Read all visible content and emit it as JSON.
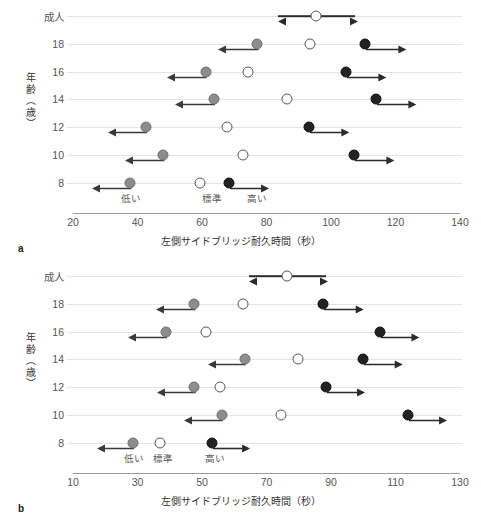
{
  "figure": {
    "panels": [
      {
        "letter": "a",
        "ylabel": "年齢（歳）",
        "xlabel": "左側サイドブリッジ耐久時間（秒）",
        "xticks": [
          "20",
          "40",
          "60",
          "80",
          "100",
          "120",
          "140"
        ],
        "zones": [
          {
            "label": "低い",
            "value": 38
          },
          {
            "label": "標準",
            "value": 63
          },
          {
            "label": "高い",
            "value": 77
          }
        ],
        "rows": [
          {
            "label": "成人",
            "low": null,
            "low_arrow_to": null,
            "normal": 95.5,
            "high": null,
            "high_arrow_to": null,
            "open_arrow_from": 83.7,
            "open_arrow_to": 107.6
          },
          {
            "label": "18",
            "low": 77.2,
            "low_arrow_to": 64.9,
            "normal": 93.4,
            "high": 110.4,
            "high_arrow_to": 122.6
          },
          {
            "label": "16",
            "low": 61.1,
            "low_arrow_to": 49.2,
            "normal": 74.2,
            "high": 104.7,
            "high_arrow_to": 116.6
          },
          {
            "label": "14",
            "low": 63.7,
            "low_arrow_to": 51.6,
            "normal": 86.3,
            "high": 113.8,
            "high_arrow_to": 125.7
          },
          {
            "label": "12",
            "low": 42.5,
            "low_arrow_to": 30.7,
            "normal": 67.7,
            "high": 93.3,
            "high_arrow_to": 105.2
          },
          {
            "label": "10",
            "low": 48.0,
            "low_arrow_to": 36.1,
            "normal": 72.6,
            "high": 107.1,
            "high_arrow_to": 119.0
          },
          {
            "label": "8",
            "low": 37.8,
            "low_arrow_to": 25.9,
            "normal": 59.4,
            "high": 68.5,
            "high_arrow_to": 80.3
          }
        ]
      },
      {
        "letter": "b",
        "ylabel": "年齢（歳）",
        "xlabel": "左側サイドブリッジ耐久時間（秒）",
        "xticks": [
          "10",
          "30",
          "50",
          "70",
          "90",
          "110",
          "130"
        ],
        "zones": [
          {
            "label": "低い",
            "value": 29
          },
          {
            "label": "標準",
            "value": 38
          },
          {
            "label": "高い",
            "value": 54
          }
        ],
        "rows": [
          {
            "label": "成人",
            "low": null,
            "low_arrow_to": null,
            "normal": 76.4,
            "high": null,
            "high_arrow_to": null,
            "open_arrow_from": 64.7,
            "open_arrow_to": 88.3
          },
          {
            "label": "18",
            "low": 47.5,
            "low_arrow_to": 35.6,
            "normal": 62.6,
            "high": 87.4,
            "high_arrow_to": 99.4
          },
          {
            "label": "16",
            "low": 38.7,
            "low_arrow_to": 26.9,
            "normal": 51.2,
            "high": 105.2,
            "high_arrow_to": 116.8
          },
          {
            "label": "14",
            "low": 63.2,
            "low_arrow_to": 51.8,
            "normal": 79.7,
            "high": 99.9,
            "high_arrow_to": 111.6
          },
          {
            "label": "12",
            "low": 47.6,
            "low_arrow_to": 35.9,
            "normal": 55.6,
            "high": 88.4,
            "high_arrow_to": 99.9
          },
          {
            "label": "10",
            "low": 56.1,
            "low_arrow_to": 44.4,
            "normal": 74.4,
            "high": 113.9,
            "high_arrow_to": 125.4
          },
          {
            "label": "8",
            "low": 28.7,
            "low_arrow_to": 17.5,
            "normal": 36.9,
            "high": 53.2,
            "high_arrow_to": 64.4
          }
        ]
      }
    ]
  },
  "chart_data": {
    "type": "scatter",
    "title": "",
    "xlabel": "左側サイドブリッジ耐久時間（秒）",
    "ylabel": "年齢（歳）",
    "categories": [
      "成人",
      "18",
      "16",
      "14",
      "12",
      "10",
      "8"
    ],
    "legend": [
      "低い（灰色・左向き矢印）",
      "標準（白丸）",
      "高い（黒丸・右向き矢印）"
    ],
    "annotations": [
      "低い",
      "標準",
      "高い"
    ],
    "grid": true,
    "panels": [
      {
        "id": "a",
        "label": "a",
        "xlim": [
          20,
          140
        ],
        "xticks": [
          20,
          40,
          60,
          80,
          100,
          120,
          140
        ],
        "series": [
          {
            "name": "低い（灰丸）",
            "marker": "gray-filled-circle",
            "values": [
              null,
              77.2,
              61.1,
              63.7,
              42.5,
              48.0,
              37.8
            ]
          },
          {
            "name": "低い矢印終点",
            "marker": "left-arrow-end",
            "values": [
              null,
              64.9,
              49.2,
              51.6,
              30.7,
              36.1,
              25.9
            ]
          },
          {
            "name": "標準（白丸）",
            "marker": "open-circle",
            "values": [
              95.5,
              93.4,
              74.2,
              86.3,
              67.7,
              72.6,
              59.4
            ]
          },
          {
            "name": "高い（黒丸）",
            "marker": "black-filled-circle",
            "values": [
              null,
              110.4,
              104.7,
              113.8,
              93.3,
              107.1,
              68.5
            ]
          },
          {
            "name": "高い矢印終点",
            "marker": "right-arrow-end",
            "values": [
              null,
              122.6,
              116.6,
              125.7,
              105.2,
              119.0,
              80.3
            ]
          },
          {
            "name": "成人両矢印範囲",
            "marker": "double-arrow",
            "values": [
              [
                83.7,
                107.6
              ],
              null,
              null,
              null,
              null,
              null,
              null
            ]
          }
        ]
      },
      {
        "id": "b",
        "label": "b",
        "xlim": [
          10,
          130
        ],
        "xticks": [
          10,
          30,
          50,
          70,
          90,
          110,
          130
        ],
        "series": [
          {
            "name": "低い（灰丸）",
            "marker": "gray-filled-circle",
            "values": [
              null,
              47.5,
              38.7,
              63.2,
              47.6,
              56.1,
              28.7
            ]
          },
          {
            "name": "低い矢印終点",
            "marker": "left-arrow-end",
            "values": [
              null,
              35.6,
              26.9,
              51.8,
              35.9,
              44.4,
              17.5
            ]
          },
          {
            "name": "標準（白丸）",
            "marker": "open-circle",
            "values": [
              76.4,
              62.6,
              51.2,
              79.7,
              55.6,
              74.4,
              36.9
            ]
          },
          {
            "name": "高い（黒丸）",
            "marker": "black-filled-circle",
            "values": [
              null,
              87.4,
              105.2,
              99.9,
              88.4,
              113.9,
              53.2
            ]
          },
          {
            "name": "高い矢印終点",
            "marker": "right-arrow-end",
            "values": [
              null,
              99.4,
              116.8,
              111.6,
              99.9,
              125.4,
              64.4
            ]
          },
          {
            "name": "成人両矢印範囲",
            "marker": "double-arrow",
            "values": [
              [
                64.7,
                88.3
              ],
              null,
              null,
              null,
              null,
              null,
              null
            ]
          }
        ]
      }
    ]
  }
}
